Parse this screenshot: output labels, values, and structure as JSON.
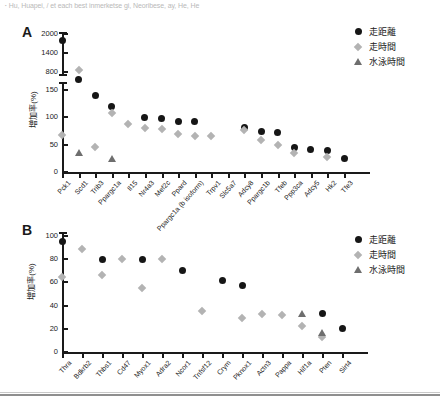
{
  "top_note": "･ Hu, Huapei, / et each best inmerketse  gi, Neoribese,  ay,  He, He",
  "legend": {
    "items": [
      {
        "label": "走距離",
        "marker": "circle",
        "color": "#161616"
      },
      {
        "label": "走時間",
        "marker": "diamond",
        "color": "#b3b3b3"
      },
      {
        "label": "水泳時間",
        "marker": "triangle",
        "color": "#6e6e6e"
      }
    ]
  },
  "panels": {
    "A": {
      "letter": "A",
      "ytitle": "増加率(%)"
    },
    "B": {
      "letter": "B",
      "ytitle": "増加率(%)"
    }
  },
  "chart_data": [
    {
      "id": "panel-A",
      "type": "scatter",
      "title": "",
      "panel_letter": "A",
      "xlabel": "",
      "ylabel": "増加率(%)",
      "broken_axis": true,
      "ylim_lower": [
        0,
        150
      ],
      "ylim_upper": [
        800,
        2000
      ],
      "yticks_lower": [
        0,
        50,
        100,
        150
      ],
      "yticks_upper": [
        800,
        1400,
        2000
      ],
      "grid": false,
      "legend_position": "right",
      "categories": [
        "Pck1",
        "Scd1",
        "Trib3",
        "Ppargc1a",
        "Il15",
        "Nr4a3",
        "Mef2c",
        "Ppard",
        "Ppargc1a (b isoform)",
        "Trpv1",
        "Slc5a7",
        "Adcy8",
        "Ppargc1b",
        "Tfeb",
        "Ppp3ca",
        "Adcy5",
        "Hk2",
        "Tfe3"
      ],
      "series": [
        {
          "name": "走距離",
          "marker": "circle",
          "color": "#161616",
          "values": [
            1800,
            170,
            140,
            120,
            null,
            100,
            98,
            92,
            92,
            null,
            null,
            82,
            74,
            72,
            45,
            42,
            40,
            25
          ]
        },
        {
          "name": "走時間",
          "marker": "diamond",
          "color": "#b3b3b3",
          "values": [
            67,
            850,
            45,
            108,
            87,
            80,
            78,
            70,
            65,
            65,
            null,
            77,
            58,
            50,
            35,
            null,
            28,
            null
          ]
        },
        {
          "name": "水泳時間",
          "marker": "triangle",
          "color": "#6e6e6e",
          "values": [
            null,
            35,
            null,
            24,
            null,
            null,
            null,
            null,
            null,
            null,
            null,
            null,
            null,
            null,
            null,
            null,
            null,
            null
          ]
        }
      ]
    },
    {
      "id": "panel-B",
      "type": "scatter",
      "title": "",
      "panel_letter": "B",
      "xlabel": "",
      "ylabel": "増加率(%)",
      "broken_axis": false,
      "ylim": [
        0,
        100
      ],
      "yticks": [
        0,
        20,
        40,
        60,
        80,
        100
      ],
      "grid": false,
      "legend_position": "right",
      "categories": [
        "Thra",
        "Bdkrb2",
        "Thbs1",
        "Cd47",
        "Myox1",
        "Adra2",
        "Ncor1",
        "Tnfsf12",
        "Crym",
        "Pknox1",
        "Actn3",
        "Pappa",
        "Hif1a",
        "Pten",
        "Sirt4"
      ],
      "series": [
        {
          "name": "走距離",
          "marker": "circle",
          "color": "#161616",
          "values": [
            95,
            null,
            80,
            null,
            80,
            null,
            70,
            null,
            62,
            57,
            null,
            null,
            null,
            33,
            20
          ]
        },
        {
          "name": "走時間",
          "marker": "diamond",
          "color": "#b3b3b3",
          "values": [
            65,
            89,
            66,
            80,
            55,
            80,
            null,
            35,
            null,
            29,
            33,
            32,
            22,
            13,
            null
          ]
        },
        {
          "name": "水泳時間",
          "marker": "triangle",
          "color": "#6e6e6e",
          "values": [
            null,
            null,
            null,
            null,
            null,
            null,
            null,
            null,
            null,
            null,
            null,
            null,
            33,
            17,
            null
          ]
        }
      ]
    }
  ]
}
